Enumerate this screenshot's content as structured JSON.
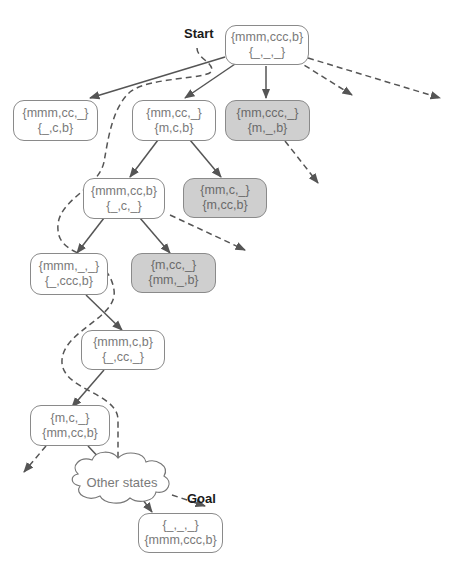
{
  "labels": {
    "start": "Start",
    "goal": "Goal",
    "other_states": "Other states"
  },
  "colors": {
    "line": "#555555",
    "node_border": "#8a8a8a",
    "dead_state_fill": "#cfcfcf",
    "text": "#7a7a7a"
  },
  "nodes": {
    "n0": {
      "top": "{mmm,ccc,b}",
      "bottom": "{_,_,_}",
      "dead": false
    },
    "n1": {
      "top": "{mmm,cc,_}",
      "bottom": "{_,c,b}",
      "dead": false
    },
    "n2": {
      "top": "{mm,cc,_}",
      "bottom": "{m,c,b}",
      "dead": false
    },
    "n3": {
      "top": "{mm,ccc,_}",
      "bottom": "{m,_,b}",
      "dead": true
    },
    "n4": {
      "top": "{mmm,cc,b}",
      "bottom": "{_,c,_}",
      "dead": false
    },
    "n5": {
      "top": "{mm,c,_}",
      "bottom": "{m,cc,b}",
      "dead": true
    },
    "n6": {
      "top": "{mmm,_,_}",
      "bottom": "{_,ccc,b}",
      "dead": false
    },
    "n7": {
      "top": "{m,cc,_}",
      "bottom": "{mm,_,b}",
      "dead": true
    },
    "n8": {
      "top": "{mmm,c,b}",
      "bottom": "{_,cc,_}",
      "dead": false
    },
    "n9": {
      "top": "{m,c,_}",
      "bottom": "{mm,cc,b}",
      "dead": false
    },
    "n10": {
      "top": "{_,_,_}",
      "bottom": "{mmm,ccc,b}",
      "dead": false
    }
  }
}
